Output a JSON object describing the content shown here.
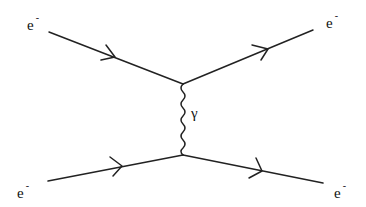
{
  "diagram": {
    "title": "",
    "type": "feynman-diagram",
    "process": "electron-electron scattering (Moller) via photon exchange",
    "particles": [
      {
        "id": "in-top",
        "label": "e",
        "charge": "-",
        "role": "incoming",
        "position": "top-left"
      },
      {
        "id": "out-top",
        "label": "e",
        "charge": "-",
        "role": "outgoing",
        "position": "top-right"
      },
      {
        "id": "in-bottom",
        "label": "e",
        "charge": "-",
        "role": "incoming",
        "position": "bottom-left"
      },
      {
        "id": "out-bottom",
        "label": "e",
        "charge": "-",
        "role": "outgoing",
        "position": "bottom-right"
      }
    ],
    "propagator": {
      "label": "γ",
      "type": "photon",
      "style": "wavy"
    },
    "vertices": [
      {
        "id": "v-top",
        "x": 183,
        "y": 84
      },
      {
        "id": "v-bottom",
        "x": 183,
        "y": 155
      }
    ],
    "colors": {
      "line": "#222222",
      "text": "#111111",
      "background": "#ffffff"
    }
  }
}
